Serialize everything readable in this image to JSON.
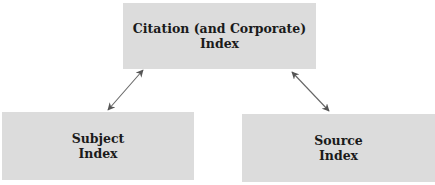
{
  "diagram": {
    "nodes": [
      {
        "id": "citation",
        "lines": [
          "Citation (and Corporate)",
          "Index"
        ]
      },
      {
        "id": "subject",
        "lines": [
          "Subject",
          "Index"
        ]
      },
      {
        "id": "source",
        "lines": [
          "Source",
          "Index"
        ]
      }
    ],
    "edges": [
      {
        "from": "citation",
        "to": "subject",
        "type": "bidirectional"
      },
      {
        "from": "citation",
        "to": "source",
        "type": "bidirectional"
      }
    ],
    "colors": {
      "box_fill": "#dcdcdc",
      "arrow": "#555555",
      "text": "#1a1a1a"
    }
  }
}
